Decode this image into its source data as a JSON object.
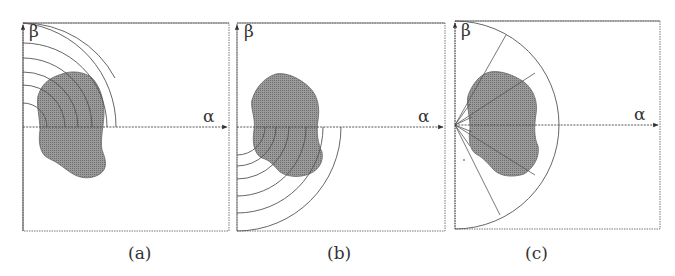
{
  "figure": {
    "panels": [
      {
        "id": "a",
        "caption": "(a)",
        "x_axis_label": "α",
        "y_axis_label": "β",
        "description": "Concentric quarter-circle arcs in upper-left quadrant over shape"
      },
      {
        "id": "b",
        "caption": "(b)",
        "x_axis_label": "α",
        "y_axis_label": "β",
        "description": "Concentric quarter-circle arcs in lower-left quadrant over shape"
      },
      {
        "id": "c",
        "caption": "(c)",
        "x_axis_label": "α",
        "y_axis_label": "β",
        "description": "Semicircle with radial rays from origin over shape"
      }
    ],
    "colors": {
      "shape_fill": "#8c8c8c",
      "line": "#555555",
      "axis": "#444444",
      "border": "#777777"
    }
  }
}
